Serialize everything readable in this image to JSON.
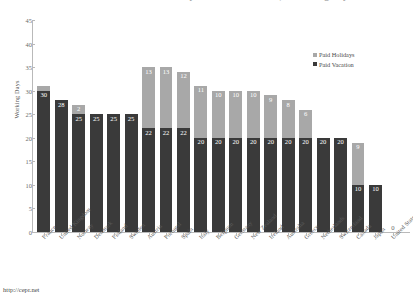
{
  "title": {
    "text": "Paid Vacation and Paid Holidays in OECD Countries, in Working Days"
  },
  "legend": {
    "position": "top-right",
    "items": [
      {
        "label": "Paid Holidays",
        "color": "#a8a8a8",
        "swatch": "square-swatch"
      },
      {
        "label": "Paid Vacation",
        "color": "#3a3a3a",
        "swatch": "square-swatch"
      }
    ]
  },
  "axes": {
    "y": {
      "label": "Working Days",
      "ticks": [
        "0",
        "5",
        "10",
        "15",
        "20",
        "25",
        "30",
        "35",
        "40",
        "45"
      ],
      "min": 0,
      "max": 45
    },
    "x": {
      "label": ""
    }
  },
  "source": {
    "url": "http://cepr.net"
  },
  "chart_data": {
    "type": "bar",
    "subtype": "stacked-bar",
    "title": "Paid Vacation and Paid Holidays in OECD Countries, in Working Days",
    "xlabel": "",
    "ylabel": "Working Days",
    "ylim": [
      0,
      45
    ],
    "ytick_step": 5,
    "grid": false,
    "legend_position": "top-right",
    "categories": [
      "France",
      "United Kingdom",
      "Norway",
      "Denmark",
      "Finland",
      "Sweden",
      "Austria",
      "Portugal",
      "Spain",
      "Italy",
      "Belgium",
      "Germany",
      "New Zealand",
      "Ireland",
      "Australia",
      "Greece",
      "Netherlands",
      "Switzerland",
      "Canada",
      "Japan",
      "United States"
    ],
    "series": [
      {
        "name": "Paid Vacation",
        "color": "#3a3a3a",
        "values": [
          30,
          28,
          25,
          25,
          25,
          25,
          22,
          22,
          22,
          20,
          20,
          20,
          20,
          20,
          20,
          20,
          20,
          20,
          10,
          10,
          0
        ]
      },
      {
        "name": "Paid Holidays",
        "color": "#a8a8a8",
        "values": [
          1,
          0,
          2,
          0,
          0,
          0,
          13,
          13,
          12,
          11,
          10,
          10,
          10,
          9,
          8,
          6,
          0,
          0,
          9,
          0,
          0
        ]
      }
    ],
    "totals": [
      31,
      28,
      27,
      25,
      25,
      25,
      35,
      35,
      34,
      31,
      30,
      30,
      30,
      29,
      28,
      26,
      20,
      20,
      19,
      10,
      0
    ],
    "bars": [
      {
        "category": "France",
        "vacation": 30,
        "holidays": 1,
        "total": 31,
        "vacation_label": "30",
        "holidays_label": ""
      },
      {
        "category": "United Kingdom",
        "vacation": 28,
        "holidays": 0,
        "total": 28,
        "vacation_label": "28",
        "holidays_label": ""
      },
      {
        "category": "Norway",
        "vacation": 25,
        "holidays": 2,
        "total": 27,
        "vacation_label": "25",
        "holidays_label": "2"
      },
      {
        "category": "Denmark",
        "vacation": 25,
        "holidays": 0,
        "total": 25,
        "vacation_label": "25",
        "holidays_label": ""
      },
      {
        "category": "Finland",
        "vacation": 25,
        "holidays": 0,
        "total": 25,
        "vacation_label": "25",
        "holidays_label": ""
      },
      {
        "category": "Sweden",
        "vacation": 25,
        "holidays": 0,
        "total": 25,
        "vacation_label": "25",
        "holidays_label": ""
      },
      {
        "category": "Austria",
        "vacation": 22,
        "holidays": 13,
        "total": 35,
        "vacation_label": "22",
        "holidays_label": "13"
      },
      {
        "category": "Portugal",
        "vacation": 22,
        "holidays": 13,
        "total": 35,
        "vacation_label": "22",
        "holidays_label": "13"
      },
      {
        "category": "Spain",
        "vacation": 22,
        "holidays": 12,
        "total": 34,
        "vacation_label": "22",
        "holidays_label": "12"
      },
      {
        "category": "Italy",
        "vacation": 20,
        "holidays": 11,
        "total": 31,
        "vacation_label": "20",
        "holidays_label": "11"
      },
      {
        "category": "Belgium",
        "vacation": 20,
        "holidays": 10,
        "total": 30,
        "vacation_label": "20",
        "holidays_label": "10"
      },
      {
        "category": "Germany",
        "vacation": 20,
        "holidays": 10,
        "total": 30,
        "vacation_label": "20",
        "holidays_label": "10"
      },
      {
        "category": "New Zealand",
        "vacation": 20,
        "holidays": 10,
        "total": 30,
        "vacation_label": "20",
        "holidays_label": "10"
      },
      {
        "category": "Ireland",
        "vacation": 20,
        "holidays": 9,
        "total": 29,
        "vacation_label": "20",
        "holidays_label": "9"
      },
      {
        "category": "Australia",
        "vacation": 20,
        "holidays": 8,
        "total": 28,
        "vacation_label": "20",
        "holidays_label": "8"
      },
      {
        "category": "Greece",
        "vacation": 20,
        "holidays": 6,
        "total": 26,
        "vacation_label": "20",
        "holidays_label": "6"
      },
      {
        "category": "Netherlands",
        "vacation": 20,
        "holidays": 0,
        "total": 20,
        "vacation_label": "20",
        "holidays_label": ""
      },
      {
        "category": "Switzerland",
        "vacation": 20,
        "holidays": 0,
        "total": 20,
        "vacation_label": "20",
        "holidays_label": ""
      },
      {
        "category": "Canada",
        "vacation": 10,
        "holidays": 9,
        "total": 19,
        "vacation_label": "10",
        "holidays_label": "9"
      },
      {
        "category": "Japan",
        "vacation": 10,
        "holidays": 0,
        "total": 10,
        "vacation_label": "10",
        "holidays_label": ""
      },
      {
        "category": "United States",
        "vacation": 0,
        "holidays": 0,
        "total": 0,
        "vacation_label": "",
        "holidays_label": "",
        "zero_label": "0"
      }
    ]
  }
}
